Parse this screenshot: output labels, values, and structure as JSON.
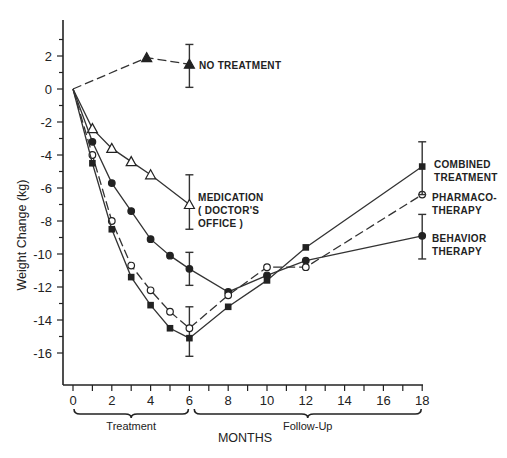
{
  "chart_data": {
    "type": "line",
    "title": "",
    "xlabel": "MONTHS",
    "ylabel": "Weight Change (kg)",
    "xlim": [
      0,
      18
    ],
    "ylim": [
      -17,
      3.5
    ],
    "x_ticks": [
      0,
      2,
      4,
      6,
      8,
      10,
      12,
      14,
      16,
      18
    ],
    "x_tick_labels": [
      "0",
      "2",
      "4",
      "6",
      "8",
      "10",
      "12",
      "14",
      "16",
      "18"
    ],
    "y_ticks": [
      2,
      0,
      -2,
      -4,
      -6,
      -8,
      -10,
      -12,
      -14,
      -16
    ],
    "y_tick_labels": [
      "2",
      "0",
      "-2",
      "-4",
      "-6",
      "-8",
      "-10",
      "-12",
      "-14",
      "-16"
    ],
    "grid": false,
    "legend_position": "inline labels at right of series",
    "phase_brackets": [
      {
        "label": "Treatment",
        "from": 0,
        "to": 6
      },
      {
        "label": "Follow-Up",
        "from": 6.2,
        "to": 18
      }
    ],
    "series": [
      {
        "name": "NO TREATMENT",
        "marker": "filled-triangle",
        "dashed": true,
        "x": [
          0,
          3.8,
          6
        ],
        "values": [
          0,
          1.9,
          1.5
        ],
        "error_bars": [
          {
            "x": 6,
            "low": 0.1,
            "high": 2.7
          }
        ]
      },
      {
        "name": "MEDICATION (DOCTOR'S OFFICE)",
        "marker": "open-triangle",
        "dashed": false,
        "x": [
          0,
          1,
          2,
          3,
          4,
          6
        ],
        "values": [
          0,
          -2.4,
          -3.6,
          -4.4,
          -5.2,
          -7.0
        ],
        "error_bars": [
          {
            "x": 6,
            "low": -8.5,
            "high": -5.2
          }
        ]
      },
      {
        "name": "BEHAVIOR THERAPY",
        "marker": "filled-circle",
        "dashed": false,
        "x": [
          0,
          1,
          2,
          3,
          4,
          5,
          6,
          8,
          10,
          12,
          18
        ],
        "values": [
          0,
          -3.2,
          -5.7,
          -7.4,
          -9.1,
          -10.1,
          -10.9,
          -12.3,
          -11.3,
          -10.4,
          -8.9
        ],
        "error_bars": [
          {
            "x": 6,
            "low": -11.9,
            "high": -9.9
          },
          {
            "x": 18,
            "low": -10.3,
            "high": -7.6
          }
        ]
      },
      {
        "name": "PHARMACOTHERAPY",
        "marker": "open-circle",
        "dashed": true,
        "x": [
          0,
          1,
          2,
          3,
          4,
          5,
          6,
          8,
          10,
          12,
          18
        ],
        "values": [
          0,
          -4.0,
          -8.0,
          -10.7,
          -12.2,
          -13.5,
          -14.5,
          -12.5,
          -10.8,
          -10.8,
          -6.4
        ],
        "error_bars": [
          {
            "x": 6,
            "low": -16.2,
            "high": -13.2
          }
        ]
      },
      {
        "name": "COMBINED TREATMENT",
        "marker": "filled-square",
        "dashed": false,
        "x": [
          0,
          1,
          2,
          3,
          4,
          5,
          6,
          8,
          10,
          12,
          18
        ],
        "values": [
          0,
          -4.5,
          -8.5,
          -11.4,
          -13.1,
          -14.5,
          -15.1,
          -13.2,
          -11.6,
          -9.6,
          -4.7
        ],
        "error_bars": [
          {
            "x": 18,
            "low": -6.4,
            "high": -3.2
          }
        ]
      }
    ]
  },
  "labels": {
    "no_treatment": [
      "NO TREATMENT"
    ],
    "medication": [
      "MEDICATION",
      "( DOCTOR'S",
      "OFFICE )"
    ],
    "combined": [
      "COMBINED",
      "TREATMENT"
    ],
    "pharmaco": [
      "PHARMACO-",
      "THERAPY"
    ],
    "behavior": [
      "BEHAVIOR",
      "THERAPY"
    ]
  }
}
